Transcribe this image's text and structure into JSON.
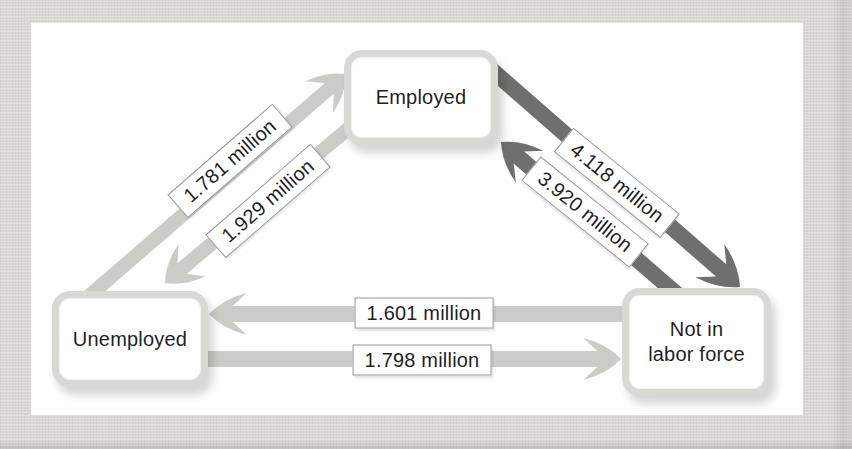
{
  "diagram": {
    "nodes": [
      {
        "id": "employed",
        "label": "Employed"
      },
      {
        "id": "unemployed",
        "label": "Unemployed"
      },
      {
        "id": "not_in_labor_force",
        "label": "Not in\nlabor force"
      }
    ],
    "flows": [
      {
        "from": "Unemployed",
        "to": "Employed",
        "label": "1.781 million"
      },
      {
        "from": "Employed",
        "to": "Unemployed",
        "label": "1.929 million"
      },
      {
        "from": "Employed",
        "to": "Not in labor force",
        "label": "4.118 million"
      },
      {
        "from": "Not in labor force",
        "to": "Employed",
        "label": "3.920 million"
      },
      {
        "from": "Not in labor force",
        "to": "Unemployed",
        "label": "1.601 million"
      },
      {
        "from": "Unemployed",
        "to": "Not in labor force",
        "label": "1.798 million"
      }
    ]
  },
  "colors": {
    "page_bg": "#d8d7d3",
    "panel_bg": "#fefefe",
    "arrow_light": "#cbcbc8",
    "arrow_dark": "#6f6f6d",
    "label_bg": "#ffffff",
    "label_border": "#97979a",
    "node_bg": "#ffffff",
    "node_ring": "#d8d8d5",
    "text": "#1f1f1f"
  }
}
